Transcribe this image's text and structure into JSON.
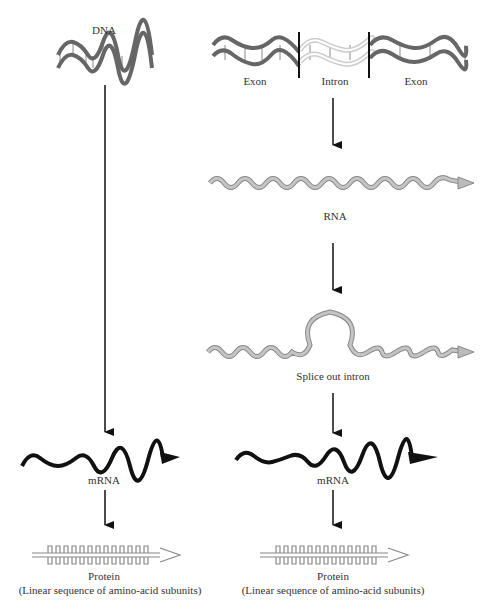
{
  "left_pathway": {
    "dna_label": "DNA",
    "mrna_label": "mRNA",
    "protein_label": "Protein",
    "protein_sublabel": "(Linear sequence of amino-acid subunits)"
  },
  "right_pathway": {
    "exon1_label": "Exon",
    "intron_label": "Intron",
    "exon2_label": "Exon",
    "rna_label": "RNA",
    "splice_label": "Splice out intron",
    "mrna_label": "mRNA",
    "protein_label": "Protein",
    "protein_sublabel": "(Linear sequence of amino-acid subunits)"
  },
  "colors": {
    "dna_strand": "#666666",
    "intron_strand": "#bdbdbd",
    "rna_fill": "#b5b5b5",
    "mrna": "#111111",
    "arrow": "#111111"
  }
}
